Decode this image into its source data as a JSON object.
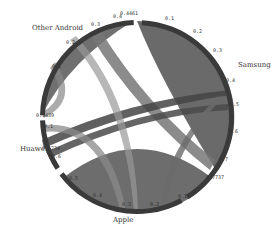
{
  "diagram": {
    "type": "chord",
    "center": [
      137,
      117
    ],
    "outer_radius": 97,
    "arc_width": 5,
    "groups": [
      {
        "name": "Samsung",
        "label_pos": [
          238,
          67
        ],
        "start_deg": -87,
        "end_deg": 58,
        "color": "#3a3a3a",
        "total_label": "0.7737"
      },
      {
        "name": "Apple",
        "label_pos": [
          113,
          222
        ],
        "start_deg": 62,
        "end_deg": 143,
        "color": "#3a3a3a",
        "total_label": ""
      },
      {
        "name": "Huawei",
        "label_pos": [
          20,
          151
        ],
        "start_deg": 147,
        "end_deg": 178,
        "color": "#3a3a3a",
        "total_label": "0.6234"
      },
      {
        "name": "Other Android",
        "label_pos": [
          32,
          30
        ],
        "start_deg": 181,
        "end_deg": 268,
        "color": "#3a3a3a",
        "total_label": "0.1439"
      }
    ],
    "tick_labels": [
      {
        "text": "0.1",
        "x": 165,
        "y": 20
      },
      {
        "text": "0.2",
        "x": 193,
        "y": 33
      },
      {
        "text": "0.3",
        "x": 213,
        "y": 52
      },
      {
        "text": "0.4",
        "x": 226,
        "y": 82
      },
      {
        "text": "0.5",
        "x": 230,
        "y": 106
      },
      {
        "text": "0.6",
        "x": 229,
        "y": 133
      },
      {
        "text": "0.7",
        "x": 219,
        "y": 161
      },
      {
        "text": "0.7737",
        "x": 206,
        "y": 179
      },
      {
        "text": "0.1",
        "x": 178,
        "y": 198
      },
      {
        "text": "0.2",
        "x": 150,
        "y": 206
      },
      {
        "text": "0.3",
        "x": 122,
        "y": 206
      },
      {
        "text": "0.4",
        "x": 93,
        "y": 197
      },
      {
        "text": "0.5",
        "x": 69,
        "y": 180
      },
      {
        "text": "0.6",
        "x": 52,
        "y": 158
      },
      {
        "text": "0.6234",
        "x": 42,
        "y": 150
      },
      {
        "text": "0.1",
        "x": 44,
        "y": 128
      },
      {
        "text": "0.1439",
        "x": 36,
        "y": 117
      },
      {
        "text": "0.1",
        "x": 52,
        "y": 68
      },
      {
        "text": "0.2",
        "x": 66,
        "y": 44
      },
      {
        "text": "0.3",
        "x": 91,
        "y": 26
      },
      {
        "text": "0.4",
        "x": 113,
        "y": 18
      },
      {
        "text": "0.4461",
        "x": 120,
        "y": 15
      }
    ]
  }
}
